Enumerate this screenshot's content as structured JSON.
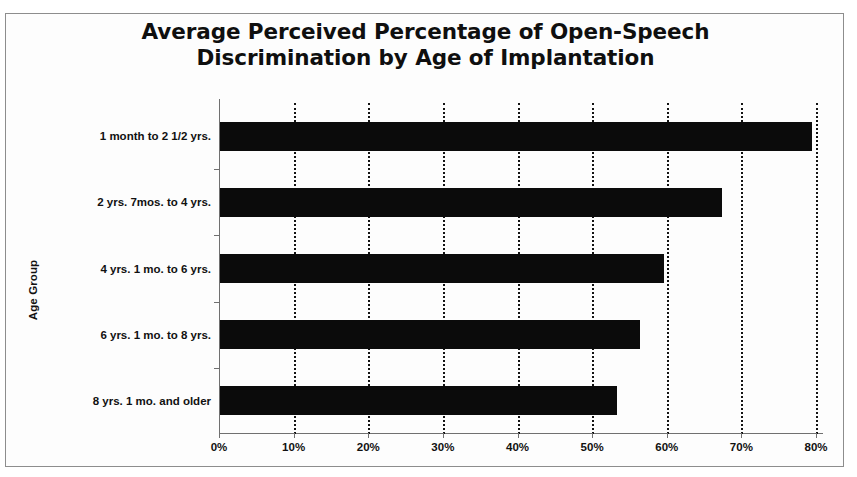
{
  "chart_data": {
    "type": "bar",
    "orientation": "horizontal",
    "title": "Average Perceived Percentage of Open-Speech Discrimination by Age of Implantation",
    "title_lines": [
      "Average Perceived Percentage of Open-Speech",
      "Discrimination by Age of Implantation"
    ],
    "ylabel": "Age Group",
    "xlabel": "",
    "categories": [
      "1 month to 2 1/2 yrs.",
      "2 yrs. 7mos. to 4 yrs.",
      "4 yrs. 1 mo. to 6 yrs.",
      "6 yrs. 1 mo. to 8 yrs.",
      "8 yrs. 1 mo. and older"
    ],
    "values": [
      79.3,
      67.3,
      59.5,
      56.3,
      53.2
    ],
    "value_labels": [
      "79%",
      "67%",
      "59%",
      "56%",
      "53%"
    ],
    "xlim": [
      0,
      80
    ],
    "xtick_labels": [
      "0%",
      "10%",
      "20%",
      "30%",
      "40%",
      "50%",
      "60%",
      "70%",
      "80%"
    ],
    "xtick_values": [
      0,
      10,
      20,
      30,
      40,
      50,
      60,
      70,
      80
    ],
    "grid": "vertical-dotted",
    "legend": null,
    "bar_color": "#0b0b0b",
    "axis_color": "#707070",
    "gridline_color": "#131313",
    "background_color": "#fdfdfd"
  }
}
